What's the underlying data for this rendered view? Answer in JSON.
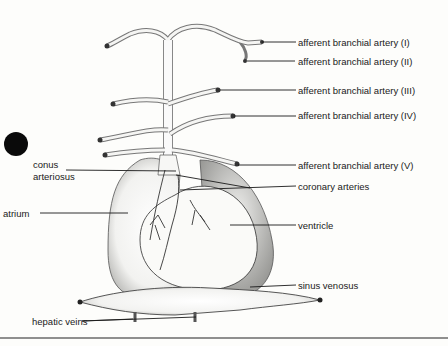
{
  "diagram": {
    "labels_right": [
      {
        "id": "aba1",
        "text": "afferent branchial artery (I)"
      },
      {
        "id": "aba2",
        "text": "afferent branchial artery (II)"
      },
      {
        "id": "aba3",
        "text": "afferent branchial artery (III)"
      },
      {
        "id": "aba4",
        "text": "afferent branchial artery (IV)"
      },
      {
        "id": "aba5",
        "text": "afferent branchial artery (V)"
      },
      {
        "id": "coronary",
        "text": "coronary arteries"
      },
      {
        "id": "ventricle",
        "text": "ventricle"
      },
      {
        "id": "sinus",
        "text": "sinus venosus"
      }
    ],
    "labels_left": [
      {
        "id": "conus1",
        "text": "conus"
      },
      {
        "id": "conus2",
        "text": "arteriosus"
      },
      {
        "id": "atrium",
        "text": "atrium"
      },
      {
        "id": "hepatic",
        "text": "hepatic veins"
      }
    ],
    "colors": {
      "ink": "#1a1a1a",
      "paper": "#fdfdfb",
      "stipple": "#9a9a9a"
    }
  }
}
